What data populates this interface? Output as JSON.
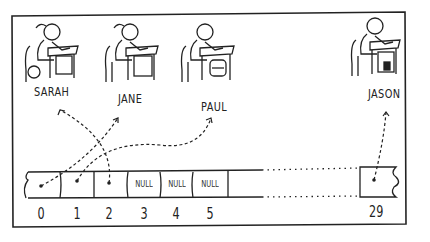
{
  "students": [
    {
      "name": "SARAH",
      "extra": "wheelchair"
    },
    {
      "name": "JANE",
      "extra": ""
    },
    {
      "name": "PAUL",
      "extra": "backpack"
    },
    {
      "name": "JASON",
      "extra": "box"
    }
  ],
  "array": {
    "cells": [
      {
        "index": "0",
        "value": "pointer",
        "points_to": "JANE"
      },
      {
        "index": "1",
        "value": "pointer",
        "points_to": "PAUL"
      },
      {
        "index": "2",
        "value": "pointer",
        "points_to": "SARAH"
      },
      {
        "index": "3",
        "value": "NULL"
      },
      {
        "index": "4",
        "value": "NULL"
      },
      {
        "index": "5",
        "value": "NULL"
      },
      {
        "index": "29",
        "value": "pointer",
        "points_to": "JASON"
      }
    ]
  },
  "colors": {
    "ink": "#222222",
    "background": "#ffffff"
  }
}
